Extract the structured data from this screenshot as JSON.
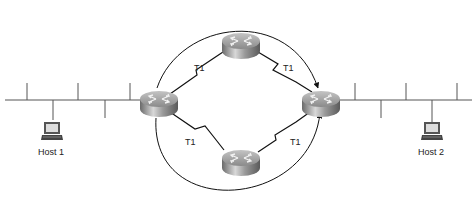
{
  "diagram": {
    "links": [
      {
        "id": "left-top",
        "label": "T1"
      },
      {
        "id": "top-right",
        "label": "T1"
      },
      {
        "id": "left-bottom",
        "label": "T1"
      },
      {
        "id": "bottom-right",
        "label": "T1"
      }
    ],
    "hosts": [
      {
        "id": "host1",
        "label": "Host 1"
      },
      {
        "id": "host2",
        "label": "Host 2"
      }
    ],
    "routers": [
      "left",
      "top",
      "bottom",
      "right"
    ],
    "paths": [
      "upper-path-arrow",
      "lower-path-arrow"
    ]
  }
}
